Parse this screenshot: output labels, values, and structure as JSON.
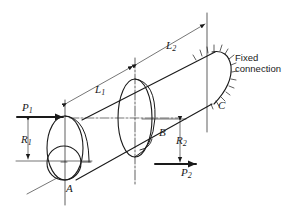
{
  "figure": {
    "labels": {
      "p1": {
        "main": "P",
        "sub": "1"
      },
      "p2": {
        "main": "P",
        "sub": "2"
      },
      "r1": {
        "main": "R",
        "sub": "1"
      },
      "r2": {
        "main": "R",
        "sub": "2"
      },
      "l1": {
        "main": "L",
        "sub": "1"
      },
      "l2": {
        "main": "L",
        "sub": "2"
      },
      "point_a": "A",
      "point_b": "B",
      "point_c": "C"
    },
    "fixed_connection": {
      "line1": "Fixed",
      "line2": "connection"
    },
    "colors": {
      "ink": "#1a1a1a",
      "background": "#ffffff"
    }
  }
}
